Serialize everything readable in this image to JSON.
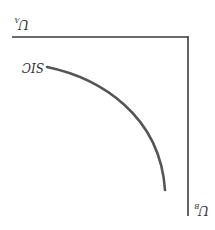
{
  "diagram": {
    "title": "",
    "orientation": "rotated 180 degrees",
    "colors": {
      "axis": "#3a3a3a",
      "curve": "#555555",
      "text": "#333333",
      "background": "#ffffff"
    },
    "axes": {
      "horizontal": {
        "label": "U",
        "subscript": "A"
      },
      "vertical": {
        "label": "U",
        "subscript": "B"
      }
    },
    "curves": [
      {
        "label": "SIC"
      }
    ]
  }
}
